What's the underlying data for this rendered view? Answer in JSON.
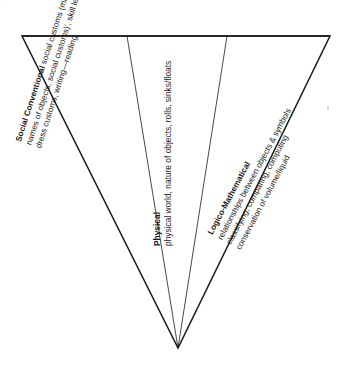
{
  "figure": {
    "type": "inverted-triangle-sector-diagram",
    "shape_name": "inverted triangle divided into three sectors",
    "background_color": "#ffffff",
    "line_color": "#1a1a1a",
    "text_color": "#1a1a1a",
    "apex": {
      "x": 178,
      "y": 348
    },
    "top_left": {
      "x": 22,
      "y": 36
    },
    "top_right": {
      "x": 330,
      "y": 36
    },
    "dividers": [
      {
        "x": 127,
        "y": 36
      },
      {
        "x": 227,
        "y": 36
      }
    ]
  },
  "sectors": [
    {
      "id": "social-conventional",
      "position": "left",
      "heading": "Social Conventional",
      "lines": [
        "Social Conventional social customs (manners, rules)",
        "names of objects, social customs)', skill learning, facts, dates",
        "dress customs, writing—reading"
      ],
      "line1_bold_prefix": "Social Conventional",
      "line1_rest": " social customs (manners, rules)",
      "line2": "names of objects, social customs)', skill learning, facts, dates",
      "line3": "dress customs, writing—reading",
      "rotation_deg": -72
    },
    {
      "id": "physical",
      "position": "middle",
      "heading": "Physical",
      "lines": [
        "Physical",
        "physical world, nature of objects, rolls, sinks/floats"
      ],
      "line1_bold_prefix": "Physical",
      "line2": "physical world, nature of objects, rolls, sinks/floats",
      "rotation_deg": -90
    },
    {
      "id": "logico-mathematical",
      "position": "right",
      "heading": "Logico-Mathematical",
      "lines": [
        "Logico-Mathematical",
        "relationships between objects & symbols",
        "classifying, comparing, computing",
        "conservation of volume/liquid"
      ],
      "line1_bold_prefix": "Logico-Mathematical",
      "line2": "relationships between objects & symbols",
      "line3": "classifying, comparing, computing",
      "line4": "conservation of volume/liquid",
      "rotation_deg": -62
    }
  ],
  "artifacts": {
    "top_row_marks": "- ·                ·"
  }
}
